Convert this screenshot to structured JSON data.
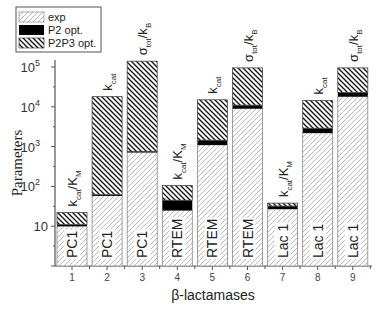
{
  "chart_data": {
    "type": "bar",
    "stacked": true,
    "yscale": "log",
    "title": "",
    "xlabel": "β-lactamases",
    "ylabel": "Parameters",
    "ylim": [
      1,
      100000
    ],
    "yticks": [
      {
        "value": 10,
        "label": "10",
        "sup": ""
      },
      {
        "value": 100,
        "label": "10",
        "sup": "2"
      },
      {
        "value": 1000,
        "label": "10",
        "sup": "3"
      },
      {
        "value": 10000,
        "label": "10",
        "sup": "4"
      },
      {
        "value": 100000,
        "label": "10",
        "sup": "5"
      }
    ],
    "categories": [
      "1",
      "2",
      "3",
      "4",
      "5",
      "6",
      "7",
      "8",
      "9"
    ],
    "enzyme_labels": [
      "PC1",
      "PC1",
      "PC1",
      "RTEM",
      "RTEM",
      "RTEM",
      "Lac 1",
      "Lac 1",
      "Lac 1"
    ],
    "parameter_labels": [
      {
        "main": "k",
        "sub": "cat",
        "rest": "/K",
        "rest_sub": "M"
      },
      {
        "main": "k",
        "sub": "cat",
        "rest": "",
        "rest_sub": ""
      },
      {
        "main": "σ",
        "sub": "tot",
        "rest": "/k",
        "rest_sub": "B"
      },
      {
        "main": "k",
        "sub": "cat",
        "rest": "/K",
        "rest_sub": "M"
      },
      {
        "main": "k",
        "sub": "cat",
        "rest": "",
        "rest_sub": ""
      },
      {
        "main": "σ",
        "sub": "tot",
        "rest": "/k",
        "rest_sub": "B"
      },
      {
        "main": "k",
        "sub": "cat",
        "rest": "/K",
        "rest_sub": "M"
      },
      {
        "main": "k",
        "sub": "cat",
        "rest": "",
        "rest_sub": ""
      },
      {
        "main": "σ",
        "sub": "tot",
        "rest": "/k",
        "rest_sub": "B"
      }
    ],
    "series": [
      {
        "name": "exp",
        "pattern": "light-hatch",
        "values": [
          10,
          60,
          750,
          25,
          1100,
          9000,
          27,
          2200,
          18000
        ]
      },
      {
        "name": "P2 opt.",
        "pattern": "solid-black",
        "values": [
          11,
          62,
          760,
          45,
          1450,
          11000,
          32,
          2900,
          23000
        ]
      },
      {
        "name": "P2P3 opt.",
        "pattern": "dark-hatch",
        "values": [
          22,
          18000,
          140000,
          105,
          15000,
          95000,
          38,
          14500,
          95000
        ]
      }
    ],
    "series_note": "Values are cumulative top heights of each stacked segment on log scale",
    "legend": {
      "position": "top-left",
      "entries": [
        "exp",
        "P2 opt.",
        "P2P3 opt."
      ]
    },
    "grid": false
  }
}
